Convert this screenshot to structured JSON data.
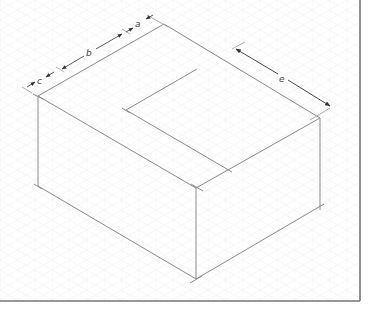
{
  "diagram": {
    "type": "isometric-drawing",
    "background": "#ffffff",
    "grid_color": "#ececec",
    "line_color": "#8a8a8a",
    "dim_color": "#333333",
    "border_color": "#777777",
    "dimensions": {
      "a": "a",
      "b": "b",
      "c": "c",
      "e": "e"
    }
  }
}
